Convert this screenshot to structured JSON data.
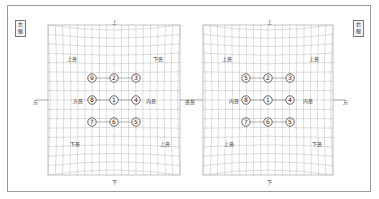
{
  "left_panel": {
    "eye_label": "左眼",
    "top": "上",
    "bottom": "下",
    "left_side": "方",
    "right_side": "鼻",
    "corner_labels": {
      "top_left": "上鼻",
      "top_right": "下鼻",
      "mid_left": "方鼻",
      "mid_right": "内鼻",
      "bottom_left": "下鼻",
      "bottom_right": "上鼻"
    },
    "points": [
      {
        "id": "9",
        "row": 0,
        "col": 0
      },
      {
        "id": "2",
        "row": 0,
        "col": 1
      },
      {
        "id": "3",
        "row": 0,
        "col": 2
      },
      {
        "id": "8",
        "row": 1,
        "col": 0
      },
      {
        "id": "1",
        "row": 1,
        "col": 1
      },
      {
        "id": "4",
        "row": 1,
        "col": 2
      },
      {
        "id": "7",
        "row": 2,
        "col": 0
      },
      {
        "id": "6",
        "row": 2,
        "col": 1
      },
      {
        "id": "5",
        "row": 2,
        "col": 2
      }
    ]
  },
  "right_panel": {
    "eye_label": "右眼",
    "top": "上",
    "bottom": "下",
    "left_side": "鼻",
    "right_side": "方",
    "corner_labels": {
      "top_left": "上鼻",
      "top_right": "上鼻",
      "mid_left": "内鼻",
      "mid_right": "内鼻",
      "bottom_left": "上鼻",
      "bottom_right": "下鼻"
    },
    "points": [
      {
        "id": "5",
        "row": 0,
        "col": 0
      },
      {
        "id": "2",
        "row": 0,
        "col": 1
      },
      {
        "id": "3",
        "row": 0,
        "col": 2
      },
      {
        "id": "8",
        "row": 1,
        "col": 0
      },
      {
        "id": "1",
        "row": 1,
        "col": 1
      },
      {
        "id": "4",
        "row": 1,
        "col": 2
      },
      {
        "id": "7",
        "row": 2,
        "col": 0
      },
      {
        "id": "6",
        "row": 2,
        "col": 1
      },
      {
        "id": "5",
        "row": 2,
        "col": 2
      }
    ]
  },
  "circled_digits": {
    "1": "①",
    "2": "②",
    "3": "③",
    "4": "④",
    "5": "⑤",
    "6": "⑥",
    "7": "⑦",
    "8": "⑧",
    "9": "⑨"
  },
  "colors": {
    "grid": "#b8b8b8",
    "frame": "#9a9a9a",
    "text": "#333333"
  }
}
